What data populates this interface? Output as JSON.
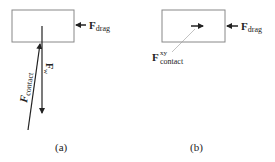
{
  "panel_a": {
    "caption": "(a)",
    "drag_label": "F",
    "drag_sub": "drag",
    "contact_label": "F",
    "contact_sub": "contact",
    "weight_label": "F",
    "weight_sub": "w"
  },
  "panel_b": {
    "caption": "(b)",
    "drag_label": "F",
    "drag_sub": "drag",
    "contact_label": "F",
    "contact_sup": "xy",
    "contact_sub": "contact"
  }
}
